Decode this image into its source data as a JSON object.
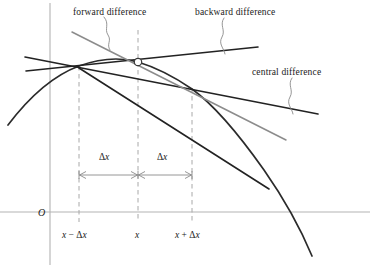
{
  "figure": {
    "type": "diagram",
    "width": 370,
    "height": 267,
    "background_color": "#ffffff"
  },
  "annotations": {
    "forward": "forward difference",
    "backward": "backward difference",
    "central": "central difference"
  },
  "axes": {
    "origin_label": "O",
    "x_axis_color": "#b3b3b3",
    "y_axis_color": "#b3b3b3",
    "x_axis_y": 212,
    "y_axis_x": 50
  },
  "ticks": [
    {
      "label_plain": "x − Δx",
      "x": 79,
      "parts": {
        "var": "x",
        "op": "−",
        "delta": "Δ",
        "dvar": "x"
      }
    },
    {
      "label_plain": "x",
      "x": 138,
      "parts": {
        "var": "x",
        "op": "",
        "delta": "",
        "dvar": ""
      }
    },
    {
      "label_plain": "x + Δx",
      "x": 192,
      "parts": {
        "var": "x",
        "op": "+",
        "delta": "Δ",
        "dvar": "x"
      }
    }
  ],
  "dimension_labels": {
    "left": "Δx",
    "right": "Δx",
    "delta_glyph": "Δ",
    "var_glyph": "x"
  },
  "colors": {
    "curve": "#2b2b2b",
    "dark_line": "#222222",
    "gray_line": "#8c8c8c",
    "dashed_guide": "#a8a8a8",
    "axis": "#b3b3b3",
    "leader": "#8a8a8a",
    "dimension_line": "#8a8a8a",
    "marker_fill": "#ffffff",
    "marker_stroke": "#3a3a3a",
    "text": "#1a1a1a"
  },
  "geometry": {
    "point_x_minus": {
      "x": 79,
      "y": 68
    },
    "point_x": {
      "x": 138,
      "y": 62
    },
    "point_x_plus": {
      "x": 192,
      "y": 89
    },
    "dimension_line_y": 175,
    "dashed_top_y": 30,
    "dashed_bottom_y": 222
  }
}
